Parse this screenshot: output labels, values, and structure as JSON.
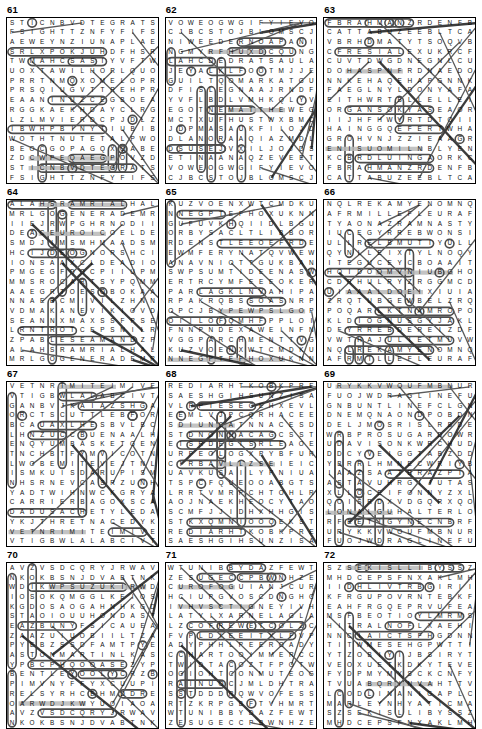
{
  "page": {
    "columns": 3,
    "rows": 4,
    "grid_cols": 15,
    "grid_rows": 17,
    "ink_color": "#000000",
    "solution_mark_color": "#5a5a5a",
    "highlight_color": "#b9b9b9"
  },
  "puzzles": [
    {
      "number": "61",
      "rows": [
        "STICNBVDTEGRAT",
        "FSIGHTTZNFYFI",
        "AEWEYNZIUNAPL",
        "SRLXPOKJUHDFH",
        "TWMAHCSASIYVF",
        "UOXTAWILHORLQ",
        "PRRTNMQXOMELO",
        "PRSQIUGVTTREH",
        "EAANINUZCEGBO",
        "RGGKAEKHDAYCL",
        "LZLMVIERDCPJD",
        "IBWHPBINYTIUB",
        "WOTHTNUTETALP",
        "BEOCGOPAGQXQA",
        "ZDCWPEQAEGPOV"
      ],
      "found_words": [
        "TARGET",
        "SIGHT",
        "WEY",
        "MAHCS",
        "PLATE",
        "SCAM"
      ]
    },
    {
      "number": "62",
      "rows": [
        "VOWEOGWGIFYIE",
        "CJBCSTOJBLOMS",
        "NIWEEDERNOAPA",
        "NGMYRFHUXDCQU",
        "LAHCDEDRATSAU",
        "JEYALKLFOOTMJ",
        "GUILTQOMARKAT",
        "DFISLEGNAAJRN",
        "YVFLBDLVMHKQL",
        "EGOTNEMATTHEW",
        "MCTXUFHUSTWXB",
        "JDPMASAUKFIIO",
        "DLANORAAQIAZM",
        "DSUSEJVXILJOJ",
        "ETINAANAQZEVE"
      ],
      "found_words": [
        "WEEDER",
        "GUILT",
        "MARK",
        "MATTHEW",
        "ANGELS",
        "AARON",
        "JESUS",
        "EVE",
        "STAR",
        "FOOT"
      ]
    },
    {
      "number": "63",
      "rows": [
        "FBRAHMANZRDEN",
        "CATTABUZEEBLT",
        "VBRHDMATYTSOQ",
        "CFRESIALEXUKR",
        "CUVTDWGDNEGNL",
        "DOHASPNFRDNAE",
        "NNKEHAQEHAPG",
        "FAEGLNYLDONYA",
        "EITHWRTBLLELL",
        "ORGANSOKYASEA",
        "IIJHFHWVRTDTO",
        "HAINGGQEFERTW",
        "GROHVNJZZIEAA",
        "ENISUOMILNBLY",
        "KCBRDLUINGAOR"
      ],
      "found_words": [
        "BRAHMAN",
        "CATTABU",
        "ORGANS",
        "LIMOUSINE",
        "ANGUI"
      ]
    },
    {
      "number": "64",
      "rows": [
        "ALAHSRAMRIALH",
        "MRLGOGENERADE",
        "IIEJRWPGHRNOD",
        "DEACEUROICOEL",
        "SMDJIMSMHMAAD",
        "HCIJDEOGNORS",
        "IONSAAXCLDEAD",
        "PMGEGFDOCPIIU",
        "MMSROCARTSYPQ",
        "AAEGRTOESOBOK",
        "NNAEBCMIVILZH",
        "VDMAKANEVIKIO",
        "SEANNXMAXSSFP",
        "LRNTROTCEPSNI",
        "ZPABLESEAMAND"
      ],
      "found_words": [
        "MARSHAL",
        "GENERAL",
        "INSPECTOR",
        "ABLE SEAMAN",
        "ADMIRAL"
      ]
    },
    {
      "number": "65",
      "rows": [
        "KUZVOENXWTCMD",
        "NNEGPTEFHOXUK",
        "GUFUVKHQIIDLB",
        "ORBYSACLTLIBB",
        "RDENSTLEEOEF",
        "EWMFERYNATQVW",
        "ANAVNIOTTGUKB",
        "SWPSUMTIDEENA",
        "ERTRCYMFEEEOK",
        "PARLAGKLNVAHI",
        "RPAKRQBSSOASN",
        "OPCJBYPEWPSLG",
        "OIILOFQMHFPPL",
        "FNNPNDEXAWEIN",
        "VGGPARCHMENTT"
      ],
      "found_words": [
        "SUMTIDE",
        "PARCHMENT",
        "WAXED",
        "GEORGE"
      ]
    },
    {
      "number": "66",
      "rows": [
        "NQLREKAMYENOM",
        "AFRMILLEFLEUR",
        "TYAONAZRAMNAS",
        "IUCEGYRREBWONS",
        "ULLRELBMUTIY",
        "QYNLLEIXTYLNO",
        "ITEGUCEYCBOAA",
        "HOIDOOMVNIUBG",
        "CDRHULRYZRGGM",
        "UIAAALDOEIXI",
        "ZRQTUBGEWBEL",
        "POQARLKTNAMRO",
        "KLDIOGNUSGYJA",
        "DFYRREBDEREIZ",
        "VWTHAJULIETMU"
      ],
      "found_words": [
        "MONEYMAKER",
        "MILLEFLEUR",
        "MARZANO",
        "SNOWBERRY",
        "TUMBLER",
        "SUNGOLD",
        "REDBERRY",
        "JULIET"
      ]
    },
    {
      "number": "67",
      "rows": [
        "VETNRIMITEIMI",
        "VTIGBWLALABCI",
        "GANBVJKAIAZSH",
        "ORCTSCUTTLEBF",
        "BCAUAXLHESBVL",
        "LHNZUCCBUENAA",
        "ENQYUMBASKETG",
        "TNCHBTFYMVICO",
        "LWOBEMITEVEJTN",
        "ISMKUISDARUP",
        "NHSRNEVCASRZU",
        "YADTWIHNWCKGR",
        "CARRIERBAGOXS",
        "DADUSACHETYLE",
        "YKJTHRETNACED"
      ],
      "found_words": [
        "SCUTTLE",
        "BASKET",
        "BOWL",
        "CARRIER BAG",
        "SACHET",
        "DECANTER"
      ]
    },
    {
      "number": "68",
      "rows": [
        "REDIARHTKOBKP",
        "SAESHGIHSUNZI",
        "VLPPIESECEHXE",
        "EEMLVJPCQRHAC",
        "SDIUNCATNNACE",
        "STDNONNACAGCS",
        "EISRDEGISRLEAO",
        "URPEOLOGXPYBF",
        "CIRBAVLLZSEIEI",
        "UAVKUSAILYPNI",
        "TSPCFQUEOOABG",
        "LRRTVMRPCHTOH",
        "AOJNAEKHEOCYT",
        "SCMFJJIDHXHHGI",
        "STKXQMNIOOQEK"
      ],
      "found_words": [
        "RAIDER",
        "SEA",
        "HIGH SEAS",
        "CANNON",
        "GALLEON",
        "PIECES OF EIGHT"
      ]
    },
    {
      "number": "69",
      "rows": [
        "URYKKVWOUFMBN",
        "FUOJWDRAGLINE",
        "GNBUNTLINEFCL",
        "DNEMQNAONDPOB",
        "DELJMOSRISLRB",
        "WRBPROSUGARDO",
        "UDAVISONKWRCH",
        "DDCYVEIGGTABZ",
        "YBRRLHMNECWRI",
        "IAAZSAATBRAZP",
        "ASTAVUHRGIJUT",
        "XLLOCEIFONNYZ",
        "QOISRDXVDGQRX",
        "LONALGUHALTER",
        "RFEETIGYNECNB"
      ],
      "found_words": [
        "DRAGLINE",
        "BUNTLINE",
        "SUGAR",
        "HALTER",
        "BRAZIL"
      ]
    },
    {
      "number": "70",
      "rows": [
        "AVZVSDCQRYJRW",
        "NKOKBSNJDVABT",
        "WDIKWPSUZUKIR",
        "IOSOKQMGGLKE",
        "KGDOSAOGAHNH",
        "STAOIOUUHONDA",
        "EAZBUNYFSICAU",
        "ZAAZUIUOBIILT",
        "PYEBZSSDFAMT",
        "ASTONMARTINLK",
        "YPBCPHQOOASEZ",
        "BENTLEYOOLYCRZ",
        "PIMVNYFFYXCUU",
        "RELSYRHCEHMDD",
        "OARWDJKWYUOIA"
      ],
      "found_words": [
        "SUZUKI",
        "HONDA",
        "ASTON MARTIN",
        "BENTLEY",
        "CHRYSLER"
      ]
    },
    {
      "number": "71",
      "rows": [
        "WTUNIBBYDAZFE",
        "ZESUGECCPBWNH",
        "CUROFOGUIANJ",
        "HCIUPGVOSCDNG",
        "IVHVSCTIGNEY",
        "LATYIXARNELAG",
        "LZCOFREWETCO",
        "FVPLDIEEITYL",
        "ADYPHHLPEERO",
        "CCHARTOOIMMER",
        "TWIDTACOZTFPO",
        "OGIOHTCONMUTE",
        "RAINUOCJMLDHT",
        "SSTDDDRQWVOFE",
        "RTZKRPGBFTVHM"
      ],
      "found_words": [
        "FOG",
        "CARNELAG",
        "WET",
        "CHART",
        "COMMUTE",
        "RAIN"
      ]
    },
    {
      "number": "72",
      "rows": [
        "SZSEKISLLIBYS",
        "MHDCEPSFNXAKL",
        "IIDHLIVTRBGIR",
        "KFRGUPOVRNTEB",
        "EAHFRGQEPRVUF",
        "MSFBEOTIOYLMR",
        "HITRALNOFLXAE",
        "NNCIAICTSFHGD",
        "TITWMESEHGPWT",
        "YTZOBIYIJBSIR",
        "VEOXUETKDKYTE",
        "FYDPMYMYSCKCN",
        "TVUABQRINVAHT",
        "LCODLINANIGAP",
        "MARLEYNHYATIC"
      ],
      "found_words": [
        "BILLIS KEYS",
        "CODLIN",
        "MARLEY",
        "PAGAN",
        "HYATIC"
      ]
    }
  ]
}
